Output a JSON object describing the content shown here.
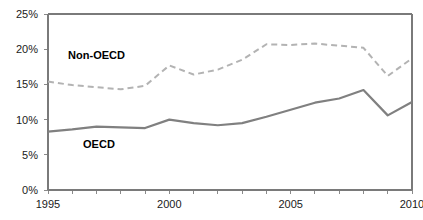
{
  "chart_data": {
    "type": "line",
    "title": "",
    "subtitle": "",
    "xlabel": "",
    "ylabel": "",
    "x": [
      1995,
      1996,
      1997,
      1998,
      1999,
      2000,
      2001,
      2002,
      2003,
      2004,
      2005,
      2006,
      2007,
      2008,
      2009,
      2010
    ],
    "xlim": [
      1995,
      2010
    ],
    "ylim": [
      0,
      25
    ],
    "y_unit": "%",
    "grid": false,
    "legend_position": "inline-annotation",
    "x_tick_labels": [
      "1995",
      "2000",
      "2005",
      "2010"
    ],
    "x_tick_values": [
      1995,
      2000,
      2005,
      2010
    ],
    "x_minor_ticks": [
      1996,
      1997,
      1998,
      1999,
      2001,
      2002,
      2003,
      2004,
      2006,
      2007,
      2008,
      2009
    ],
    "y_tick_labels": [
      "0%",
      "5%",
      "10%",
      "15%",
      "20%",
      "25%"
    ],
    "y_tick_values": [
      0,
      5,
      10,
      15,
      20,
      25
    ],
    "series": [
      {
        "name": "Non-OECD",
        "label": "Non-OECD",
        "style": "dashed",
        "color": "#b3b3b3",
        "values": [
          15.4,
          14.9,
          14.6,
          14.3,
          14.8,
          17.7,
          16.4,
          17.1,
          18.5,
          20.7,
          20.6,
          20.8,
          20.5,
          20.2,
          16.2,
          18.7
        ]
      },
      {
        "name": "OECD",
        "label": "OECD",
        "style": "solid",
        "color": "#808080",
        "values": [
          8.3,
          8.6,
          9.0,
          8.9,
          8.8,
          10.0,
          9.5,
          9.2,
          9.5,
          10.4,
          11.4,
          12.4,
          13.0,
          14.2,
          10.6,
          12.5
        ]
      }
    ],
    "annotations": [
      {
        "text": "Non-OECD",
        "x": 1997.0,
        "y": 18.6
      },
      {
        "text": "OECD",
        "x": 1997.1,
        "y": 5.9
      }
    ],
    "colors": {
      "oecd_line": "#808080",
      "non_oecd_line": "#b3b3b3",
      "axis": "#808080",
      "text": "#1a1a1a",
      "background": "#ffffff"
    }
  }
}
